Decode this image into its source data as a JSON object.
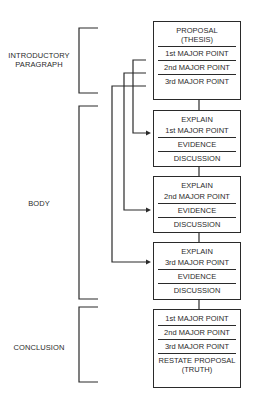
{
  "sections": {
    "intro": {
      "label_line1": "INTRODUCTORY",
      "label_line2": "PARAGRAPH"
    },
    "body": {
      "label": "BODY"
    },
    "conclusion": {
      "label": "CONCLUSION"
    }
  },
  "boxes": {
    "proposal": {
      "title_line1": "PROPOSAL",
      "title_line2": "(THESIS)",
      "point1": "1st MAJOR POINT",
      "point2": "2nd MAJOR POINT",
      "point3": "3rd MAJOR POINT"
    },
    "explain1": {
      "title": "EXPLAIN",
      "point": "1st MAJOR POINT",
      "evidence": "EVIDENCE",
      "discussion": "DISCUSSION"
    },
    "explain2": {
      "title": "EXPLAIN",
      "point": "2nd MAJOR POINT",
      "evidence": "EVIDENCE",
      "discussion": "DISCUSSION"
    },
    "explain3": {
      "title": "EXPLAIN",
      "point": "3rd MAJOR POINT",
      "evidence": "EVIDENCE",
      "discussion": "DISCUSSION"
    },
    "conclusion": {
      "point1": "1st MAJOR POINT",
      "point2": "2nd MAJOR POINT",
      "point3": "3rd MAJOR POINT",
      "restate_line1": "RESTATE PROPOSAL",
      "restate_line2": "(TRUTH)"
    }
  },
  "colors": {
    "line": "#2a2a2a",
    "background": "#ffffff"
  }
}
